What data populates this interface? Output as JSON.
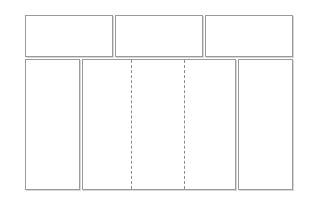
{
  "diagram": {
    "type": "wireframe-layout",
    "colors": {
      "border": "#9a9a9a",
      "dash": "#8c8c8c",
      "background": "#ffffff"
    },
    "top_row": [
      {
        "name": "top-panel-1",
        "x": 25,
        "y": 15,
        "w": 88,
        "h": 42
      },
      {
        "name": "top-panel-2",
        "x": 115,
        "y": 15,
        "w": 88,
        "h": 42
      },
      {
        "name": "top-panel-3",
        "x": 205,
        "y": 15,
        "w": 88,
        "h": 42
      }
    ],
    "bottom_row": [
      {
        "name": "left-sidebar",
        "x": 25,
        "y": 59,
        "w": 55,
        "h": 131
      },
      {
        "name": "main-content",
        "x": 82,
        "y": 59,
        "w": 154,
        "h": 131,
        "dashed_dividers_x": [
          131,
          184
        ]
      },
      {
        "name": "right-sidebar",
        "x": 238,
        "y": 59,
        "w": 55,
        "h": 131
      }
    ]
  }
}
